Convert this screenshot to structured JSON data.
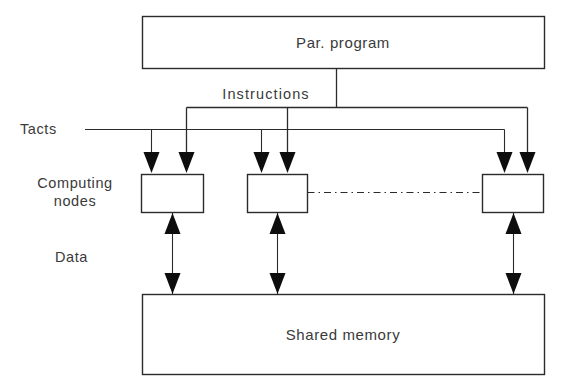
{
  "diagram": {
    "blocks": {
      "par_program": "Par. program",
      "shared_memory": "Shared memory"
    },
    "side_labels": {
      "tacts": "Tacts",
      "computing_nodes_line1": "Computing",
      "computing_nodes_line2": "nodes",
      "data": "Data"
    },
    "bus_labels": {
      "instructions": "Instructions"
    },
    "nodes": [
      {
        "id": "node-1",
        "label": ""
      },
      {
        "id": "node-2",
        "label": ""
      },
      {
        "id": "node-3",
        "label": ""
      }
    ],
    "connections": {
      "instructions_bus": "Instructions bus from parallel program to computing nodes",
      "tacts_bus": "Tacts clock bus to computing nodes",
      "data_links": "Bidirectional data links between computing nodes and shared memory",
      "node_continuation": "Dash-dot ellipsis between node 2 and node 3"
    },
    "colors": {
      "stroke": "#2b2b2b",
      "text": "#3a3a3a",
      "background": "#ffffff",
      "arrow_fill": "#0d0d0d"
    }
  }
}
